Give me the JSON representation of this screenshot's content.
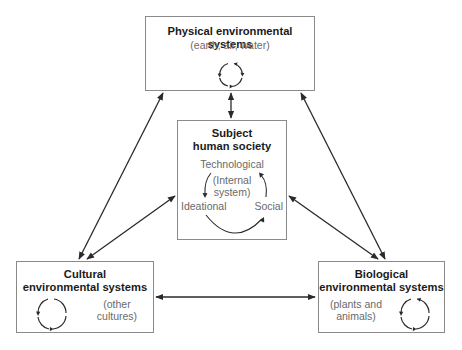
{
  "diagram": {
    "nodes": {
      "physical": {
        "title": "Physical environmental systems",
        "subtitle": "(earth, air, water)"
      },
      "subject": {
        "title_line1": "Subject",
        "title_line2": "human society",
        "components": {
          "top": "Technological",
          "left": "Ideational",
          "right": "Social"
        },
        "center_line1": "(Internal",
        "center_line2": "system)"
      },
      "cultural": {
        "title_line1": "Cultural",
        "title_line2": "environmental systems",
        "subtitle_line1": "(other",
        "subtitle_line2": "cultures)"
      },
      "biological": {
        "title_line1": "Biological",
        "title_line2": "environmental systems",
        "subtitle_line1": "(plants and",
        "subtitle_line2": "animals)"
      }
    },
    "edges": [
      {
        "from": "physical",
        "to": "subject",
        "type": "bidirectional"
      },
      {
        "from": "physical",
        "to": "cultural",
        "type": "bidirectional"
      },
      {
        "from": "physical",
        "to": "biological",
        "type": "bidirectional"
      },
      {
        "from": "subject",
        "to": "cultural",
        "type": "bidirectional"
      },
      {
        "from": "subject",
        "to": "biological",
        "type": "bidirectional"
      },
      {
        "from": "cultural",
        "to": "biological",
        "type": "bidirectional"
      }
    ],
    "colors": {
      "line": "#2a2a2a",
      "box_border": "#8a8a8a",
      "title_text": "#1a1a1a",
      "subtitle_text": "#6a6a6a"
    }
  }
}
